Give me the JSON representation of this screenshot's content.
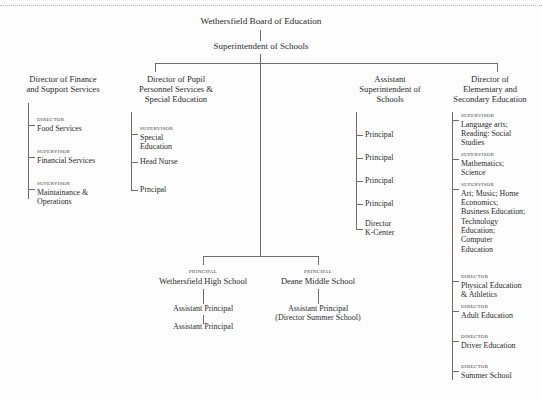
{
  "root": {
    "title": "Wethersfield Board of Education"
  },
  "superintendent": {
    "title": "Superintendent of Schools"
  },
  "columns": [
    {
      "heading": "Director of Finance\nand Support Services",
      "heading_lines": [
        "Director of Finance",
        "and Support Services"
      ],
      "reports": [
        {
          "role": "Director",
          "title": "Food Services"
        },
        {
          "role": "Supervisor",
          "title": "Financial Services"
        },
        {
          "role": "Supervisor",
          "title": "Maintainance &\nOperations",
          "lines": [
            "Maintainance &",
            "Operations"
          ]
        }
      ]
    },
    {
      "heading": "Director of Pupil\nPersonnel Services &\nSpecial Education",
      "heading_lines": [
        "Director of Pupil",
        "Personnel Services &",
        "Special Education"
      ],
      "reports": [
        {
          "role": "Supervisor",
          "title": "Special\nEducation",
          "lines": [
            "Special",
            "Education"
          ]
        },
        {
          "role": "",
          "title": "Head Nurse"
        },
        {
          "role": "",
          "title": "Prncipal"
        }
      ]
    },
    {
      "heading": "Assistant\nSuperintendent of\nSchools",
      "heading_lines": [
        "Assistant",
        "Superintendent of",
        "Schools"
      ],
      "reports": [
        {
          "role": "",
          "title": "Principal"
        },
        {
          "role": "",
          "title": "Principal"
        },
        {
          "role": "",
          "title": "Principal"
        },
        {
          "role": "",
          "title": "Principal"
        },
        {
          "role": "",
          "title": "Director\nK-Center",
          "lines": [
            "Director",
            "K-Center"
          ]
        }
      ]
    },
    {
      "heading": "Director of\nElementary and\nSecondary Education",
      "heading_lines": [
        "Director of",
        "Elementary and",
        "Secondary Education"
      ],
      "reports": [
        {
          "role": "Supervisor",
          "title": "Language arts;\nReading: Social\nStudies",
          "lines": [
            "Language arts;",
            "Reading: Social",
            "Studies"
          ]
        },
        {
          "role": "Supervisor",
          "title": "Mathematics;\nScience",
          "lines": [
            "Mathematics;",
            "Science"
          ]
        },
        {
          "role": "Supervisor",
          "title": "Art; Music; Home\nEconomics;\nBusiness Education;\nTechnology\nEducation;\nComputer\nEducation",
          "lines": [
            "Art; Music; Home",
            "Economics;",
            "Business Education;",
            "Technology",
            "Education;",
            "Computer",
            "Education"
          ]
        },
        {
          "role": "Director",
          "title": "Physical Education\n& Athletics",
          "lines": [
            "Physical Education",
            "& Athletics"
          ]
        },
        {
          "role": "Director",
          "title": "Adult Education"
        },
        {
          "role": "Director",
          "title": "Driver Education"
        },
        {
          "role": "Director",
          "title": "Summer School"
        }
      ]
    }
  ],
  "schools": [
    {
      "role": "Principal",
      "name": "Wethersfield High School",
      "subordinates": [
        "Assistant Principal",
        "Assistant Principal"
      ]
    },
    {
      "role": "Principal",
      "name": "Deane Middle School",
      "subordinates": [
        "Assistant Principal",
        "(Director Summer School)"
      ]
    }
  ],
  "colors": {
    "line": "#6e6e6e",
    "text": "#2b2b2b",
    "rule": "#b9b9b9",
    "background": "#fdfdfd"
  }
}
